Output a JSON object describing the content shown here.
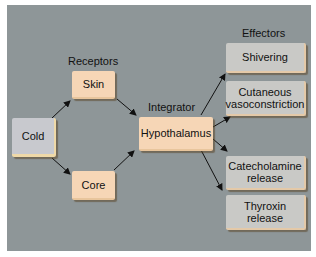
{
  "diagram": {
    "headings": {
      "receptors": "Receptors",
      "integrator": "Integrator",
      "effectors": "Effectors"
    },
    "nodes": {
      "stimulus": "Cold",
      "skin": "Skin",
      "core": "Core",
      "integrator": "Hypothalamus",
      "shivering": "Shivering",
      "vasoconstriction_line1": "Cutaneous",
      "vasoconstriction_line2": "vasoconstriction",
      "catecholamine_line1": "Catecholamine",
      "catecholamine_line2": "release",
      "thyroxin_line1": "Thyroxin",
      "thyroxin_line2": "release"
    },
    "edges": [
      {
        "from": "Cold",
        "to": "Skin"
      },
      {
        "from": "Cold",
        "to": "Core"
      },
      {
        "from": "Skin",
        "to": "Hypothalamus"
      },
      {
        "from": "Core",
        "to": "Hypothalamus"
      },
      {
        "from": "Hypothalamus",
        "to": "Shivering"
      },
      {
        "from": "Hypothalamus",
        "to": "Cutaneous vasoconstriction"
      },
      {
        "from": "Hypothalamus",
        "to": "Catecholamine release"
      },
      {
        "from": "Hypothalamus",
        "to": "Thyroxin release"
      }
    ],
    "colors": {
      "background": "#8e9698",
      "receptor_box": "#f6d6b6",
      "effector_box": "#c9c9c6",
      "stimulus_box": "#c8c9ce"
    }
  }
}
